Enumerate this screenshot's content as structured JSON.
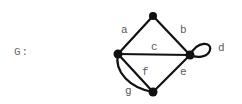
{
  "graph": {
    "name": "G:",
    "colors": {
      "edge": "#111111",
      "vertex": "#111111",
      "label": "#5a5a5a"
    },
    "vertices": [
      {
        "id": "top",
        "x": 153,
        "y": 16
      },
      {
        "id": "left",
        "x": 118,
        "y": 54
      },
      {
        "id": "right",
        "x": 190,
        "y": 55
      },
      {
        "id": "bottom",
        "x": 153,
        "y": 92
      }
    ],
    "edges": [
      {
        "label": "a",
        "from": "left",
        "to": "top",
        "type": "line"
      },
      {
        "label": "b",
        "from": "top",
        "to": "right",
        "type": "line"
      },
      {
        "label": "c",
        "from": "left",
        "to": "right",
        "type": "line"
      },
      {
        "label": "d",
        "from": "right",
        "to": "right",
        "type": "loop"
      },
      {
        "label": "e",
        "from": "right",
        "to": "bottom",
        "type": "line"
      },
      {
        "label": "f",
        "from": "left",
        "to": "bottom",
        "type": "line"
      },
      {
        "label": "g",
        "from": "left",
        "to": "bottom",
        "type": "curve"
      }
    ]
  }
}
